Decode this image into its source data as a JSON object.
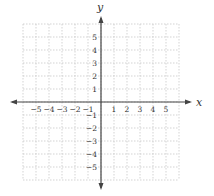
{
  "chart_data": {
    "type": "scatter",
    "title": "",
    "xlabel": "x",
    "ylabel": "y",
    "xlim": [
      -6,
      6
    ],
    "ylim": [
      -6,
      6
    ],
    "x_ticks": [
      -5,
      -4,
      -3,
      -2,
      -1,
      1,
      2,
      3,
      4,
      5
    ],
    "y_ticks": [
      5,
      4,
      3,
      2,
      1,
      -1,
      -2,
      -3,
      -4,
      -5
    ],
    "x_tick_labels": [
      "−5",
      "−4",
      "−3",
      "−2",
      "−1",
      "1",
      "2",
      "3",
      "4",
      "5"
    ],
    "y_tick_labels": [
      "5",
      "4",
      "3",
      "2",
      "1",
      "−1",
      "−2",
      "−3",
      "−4",
      "−5"
    ],
    "grid": true,
    "grid_style": "dotted",
    "series": [],
    "colors": {
      "axis": "#444444",
      "grid": "#c8c8c8",
      "text": "#333333"
    }
  }
}
